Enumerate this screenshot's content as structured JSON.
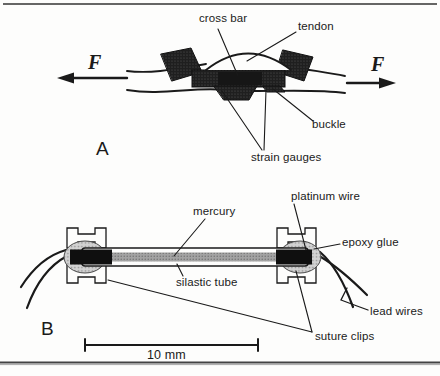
{
  "panel_a": {
    "label": "A",
    "force_left": "F",
    "force_right": "F",
    "annotations": {
      "cross_bar": "cross bar",
      "tendon": "tendon",
      "buckle": "buckle",
      "strain_gauges": "strain gauges"
    }
  },
  "panel_b": {
    "label": "B",
    "scale_bar_label": "10 mm",
    "annotations": {
      "platinum_wire": "platinum wire",
      "mercury": "mercury",
      "epoxy_glue": "epoxy glue",
      "silastic_tube": "silastic tube",
      "lead_wires": "lead wires",
      "suture_clips": "suture clips"
    }
  },
  "colors": {
    "ink": "#1a1a1a",
    "buckle_fill": "#1f1f1f",
    "mercury_gray": "#a3a3a3",
    "epoxy_gray": "#d2d2d2"
  }
}
